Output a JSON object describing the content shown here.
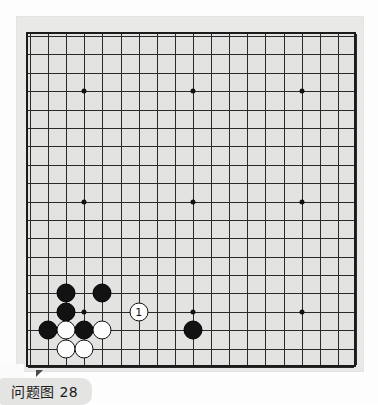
{
  "figure": {
    "caption": "问题图 28",
    "caption_label": "问题图",
    "caption_number": "28"
  },
  "board": {
    "type": "go-board",
    "size": 19,
    "columns": 19,
    "rows": 19,
    "background_color": "#e3e3e1",
    "line_color": "#2a2a2a",
    "border_color": "#1b1b1b",
    "mat_color": "#e9e9e7",
    "star_points": [
      {
        "col": 4,
        "row": 4
      },
      {
        "col": 10,
        "row": 4
      },
      {
        "col": 16,
        "row": 4
      },
      {
        "col": 4,
        "row": 10
      },
      {
        "col": 10,
        "row": 10
      },
      {
        "col": 16,
        "row": 10
      },
      {
        "col": 4,
        "row": 16
      },
      {
        "col": 10,
        "row": 16
      },
      {
        "col": 16,
        "row": 16
      }
    ]
  },
  "stones": [
    {
      "color": "black",
      "col": 3,
      "row": 15,
      "label": ""
    },
    {
      "color": "black",
      "col": 5,
      "row": 15,
      "label": ""
    },
    {
      "color": "black",
      "col": 3,
      "row": 16,
      "label": ""
    },
    {
      "color": "black",
      "col": 2,
      "row": 17,
      "label": ""
    },
    {
      "color": "black",
      "col": 4,
      "row": 17,
      "label": ""
    },
    {
      "color": "black",
      "col": 10,
      "row": 17,
      "label": ""
    },
    {
      "color": "white",
      "col": 3,
      "row": 17,
      "label": ""
    },
    {
      "color": "white",
      "col": 5,
      "row": 17,
      "label": ""
    },
    {
      "color": "white",
      "col": 3,
      "row": 18,
      "label": ""
    },
    {
      "color": "white",
      "col": 4,
      "row": 18,
      "label": ""
    },
    {
      "color": "white",
      "col": 7,
      "row": 16,
      "label": "1"
    }
  ],
  "colors": {
    "black_stone": "#121212",
    "white_stone": "#fdfdfd",
    "page_background": "#fdfdfd",
    "caption_pill": "#e4e4e2",
    "corner_tab": "#4a4a4a"
  }
}
